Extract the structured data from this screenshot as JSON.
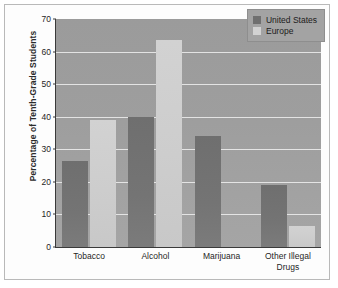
{
  "chart_data": {
    "type": "bar",
    "title": "",
    "xlabel": "",
    "ylabel": "Percentage of Tenth-Grade Students",
    "ylim": [
      0,
      70
    ],
    "yticks": [
      0,
      10,
      20,
      30,
      40,
      50,
      60,
      70
    ],
    "grid": true,
    "legend_position": "top-right inside plot",
    "categories": [
      "Tobacco",
      "Alcohol",
      "Marijuana",
      "Other Illegal Drugs"
    ],
    "category_lines": [
      [
        "Tobacco"
      ],
      [
        "Alcohol"
      ],
      [
        "Marijuana"
      ],
      [
        "Other Illegal",
        "Drugs"
      ]
    ],
    "series": [
      {
        "name": "United States",
        "color": "#6f6f6f",
        "values": [
          26.5,
          40,
          34,
          19
        ]
      },
      {
        "name": "Europe",
        "color": "#d2d2d2",
        "values": [
          39,
          63.5,
          0,
          6.5
        ]
      }
    ]
  },
  "legend": {
    "items": [
      {
        "label": "United States",
        "color": "#6f6f6f"
      },
      {
        "label": "Europe",
        "color": "#d2d2d2"
      }
    ]
  },
  "colors": {
    "plot_background": "#9e9e9e",
    "gridline": "#e9e9e9",
    "axis": "#3a3a3a",
    "page_background": "#fdfdfd",
    "frame_border": "#b9b9b9",
    "series_us": "#6f6f6f",
    "series_europe": "#d2d2d2"
  }
}
